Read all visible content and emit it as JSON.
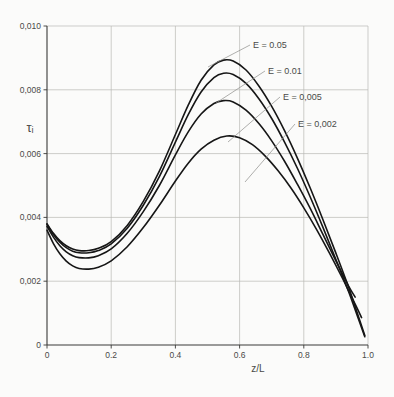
{
  "chart_data": {
    "type": "line",
    "title": "",
    "subtitle": "",
    "xlabel": "z/L",
    "ylabel": "τᵢ",
    "xlim": [
      0,
      1.0
    ],
    "ylim": [
      0,
      0.01
    ],
    "xticks": [
      "0",
      "0.2",
      "0.4",
      "0.6",
      "0.8",
      "1.0"
    ],
    "xtickvals": [
      0,
      0.2,
      0.4,
      0.6,
      0.8,
      1.0
    ],
    "yticks": [
      "0",
      "0,002",
      "0,004",
      "0,006",
      "0,008",
      "0,010"
    ],
    "ytickvals": [
      0,
      0.002,
      0.004,
      0.006,
      0.008,
      0.01
    ],
    "grid": true,
    "legend_position": "inline-annotations",
    "series": [
      {
        "name": "E = 0.05",
        "label": "E = 0.05",
        "x": [
          0.0,
          0.02,
          0.04,
          0.06,
          0.08,
          0.1,
          0.13,
          0.16,
          0.2,
          0.25,
          0.3,
          0.35,
          0.4,
          0.44,
          0.48,
          0.52,
          0.55,
          0.58,
          0.62,
          0.66,
          0.7,
          0.74,
          0.78,
          0.82,
          0.86,
          0.9,
          0.94,
          0.97,
          0.99
        ],
        "y": [
          0.0038,
          0.0035,
          0.00327,
          0.00311,
          0.00301,
          0.00296,
          0.00296,
          0.00303,
          0.00324,
          0.00375,
          0.0045,
          0.00545,
          0.0066,
          0.00752,
          0.0083,
          0.00878,
          0.00893,
          0.0089,
          0.00862,
          0.00812,
          0.00748,
          0.00672,
          0.00586,
          0.00492,
          0.00392,
          0.00288,
          0.0018,
          0.0009,
          0.0003
        ]
      },
      {
        "name": "E = 0.01",
        "label": "E = 0.01",
        "x": [
          0.0,
          0.02,
          0.04,
          0.06,
          0.08,
          0.1,
          0.13,
          0.16,
          0.2,
          0.25,
          0.3,
          0.35,
          0.4,
          0.44,
          0.48,
          0.52,
          0.55,
          0.58,
          0.62,
          0.66,
          0.7,
          0.74,
          0.78,
          0.82,
          0.86,
          0.9,
          0.94,
          0.97,
          0.99
        ],
        "y": [
          0.00378,
          0.00346,
          0.00322,
          0.00305,
          0.00294,
          0.00289,
          0.00289,
          0.00296,
          0.00317,
          0.00366,
          0.00438,
          0.00528,
          0.00636,
          0.00722,
          0.00793,
          0.00838,
          0.00852,
          0.00848,
          0.0082,
          0.00772,
          0.0071,
          0.00636,
          0.00554,
          0.00464,
          0.00368,
          0.00268,
          0.00166,
          0.00082,
          0.00026
        ]
      },
      {
        "name": "E = 0.005",
        "label": "E = 0,005",
        "x": [
          0.0,
          0.02,
          0.04,
          0.06,
          0.08,
          0.1,
          0.13,
          0.16,
          0.2,
          0.25,
          0.3,
          0.35,
          0.4,
          0.44,
          0.48,
          0.52,
          0.55,
          0.58,
          0.62,
          0.66,
          0.7,
          0.74,
          0.78,
          0.82,
          0.86,
          0.9,
          0.94,
          0.96
        ],
        "y": [
          0.00372,
          0.00338,
          0.00311,
          0.00292,
          0.0028,
          0.00274,
          0.00273,
          0.0028,
          0.00301,
          0.0035,
          0.00418,
          0.005,
          0.00596,
          0.00668,
          0.00724,
          0.00757,
          0.00766,
          0.00762,
          0.00736,
          0.00694,
          0.0064,
          0.00576,
          0.00504,
          0.00428,
          0.00346,
          0.00264,
          0.00184,
          0.0015
        ]
      },
      {
        "name": "E = 0.002",
        "label": "E = 0,002",
        "x": [
          0.0,
          0.02,
          0.04,
          0.06,
          0.08,
          0.1,
          0.13,
          0.16,
          0.2,
          0.25,
          0.3,
          0.35,
          0.4,
          0.44,
          0.48,
          0.52,
          0.56,
          0.6,
          0.64,
          0.68,
          0.72,
          0.76,
          0.8,
          0.84,
          0.88,
          0.92,
          0.96,
          0.98
        ],
        "y": [
          0.0036,
          0.00318,
          0.00286,
          0.00263,
          0.00248,
          0.0024,
          0.00238,
          0.00244,
          0.00264,
          0.00308,
          0.00368,
          0.00438,
          0.00514,
          0.0057,
          0.00614,
          0.00642,
          0.00655,
          0.0065,
          0.00628,
          0.00592,
          0.00546,
          0.00492,
          0.0043,
          0.00362,
          0.00288,
          0.0021,
          0.00128,
          0.00086
        ]
      }
    ],
    "annotations": [
      {
        "label": "E = 0.05",
        "text_x": 253,
        "text_y": 48,
        "leader": [
          [
            250,
            45
          ],
          [
            208,
            67
          ]
        ]
      },
      {
        "label": "E = 0.01",
        "text_x": 268,
        "text_y": 74,
        "leader": [
          [
            265,
            71
          ],
          [
            216,
            103
          ]
        ]
      },
      {
        "label": "E = 0,005",
        "text_x": 283,
        "text_y": 100,
        "leader": [
          [
            280,
            97
          ],
          [
            228,
            142
          ]
        ]
      },
      {
        "label": "E = 0,002",
        "text_x": 298,
        "text_y": 127,
        "leader": [
          [
            295,
            124
          ],
          [
            245,
            182
          ]
        ]
      }
    ]
  }
}
